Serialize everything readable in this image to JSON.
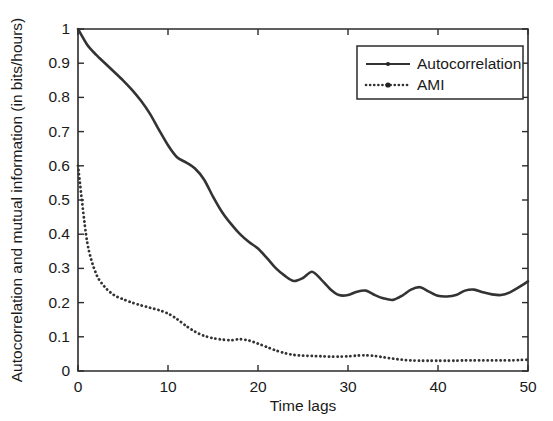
{
  "chart_data": {
    "type": "line",
    "title": "",
    "xlabel": "Time lags",
    "ylabel": "Autocorrelation and mutual information (in bits/hours)",
    "xlim": [
      0,
      50
    ],
    "ylim": [
      0,
      1
    ],
    "xticks": [
      "0",
      "10",
      "20",
      "30",
      "40",
      "50"
    ],
    "xtick_values": [
      0,
      10,
      20,
      30,
      40,
      50
    ],
    "yticks": [
      "0",
      "0.1",
      "0.2",
      "0.3",
      "0.4",
      "0.5",
      "0.6",
      "0.7",
      "0.8",
      "0.9",
      "1"
    ],
    "ytick_values": [
      0,
      0.1,
      0.2,
      0.3,
      0.4,
      0.5,
      0.6,
      0.7,
      0.8,
      0.9,
      1
    ],
    "grid": false,
    "legend_position": "upper right",
    "x": [
      0,
      1,
      2,
      3,
      4,
      5,
      6,
      7,
      8,
      9,
      10,
      11,
      12,
      13,
      14,
      15,
      16,
      17,
      18,
      19,
      20,
      21,
      22,
      23,
      24,
      25,
      26,
      27,
      28,
      29,
      30,
      31,
      32,
      33,
      34,
      35,
      36,
      37,
      38,
      39,
      40,
      41,
      42,
      43,
      44,
      45,
      46,
      47,
      48,
      49,
      50
    ],
    "series": [
      {
        "name": "Autocorrelation",
        "style": "solid",
        "marker": "dot",
        "values": [
          1.0,
          0.955,
          0.925,
          0.9,
          0.875,
          0.85,
          0.822,
          0.79,
          0.752,
          0.705,
          0.66,
          0.625,
          0.61,
          0.592,
          0.56,
          0.51,
          0.465,
          0.43,
          0.4,
          0.377,
          0.358,
          0.33,
          0.3,
          0.278,
          0.263,
          0.272,
          0.29,
          0.268,
          0.24,
          0.222,
          0.222,
          0.232,
          0.235,
          0.222,
          0.212,
          0.208,
          0.22,
          0.238,
          0.245,
          0.232,
          0.22,
          0.218,
          0.222,
          0.235,
          0.238,
          0.23,
          0.224,
          0.222,
          0.23,
          0.245,
          0.262
        ]
      },
      {
        "name": "AMI",
        "style": "dotted",
        "marker": "dot",
        "values": [
          0.6,
          0.38,
          0.285,
          0.245,
          0.222,
          0.21,
          0.2,
          0.192,
          0.185,
          0.178,
          0.168,
          0.152,
          0.132,
          0.115,
          0.103,
          0.096,
          0.092,
          0.09,
          0.093,
          0.089,
          0.08,
          0.07,
          0.06,
          0.052,
          0.047,
          0.045,
          0.044,
          0.043,
          0.042,
          0.042,
          0.043,
          0.045,
          0.046,
          0.044,
          0.04,
          0.036,
          0.033,
          0.031,
          0.03,
          0.03,
          0.03,
          0.03,
          0.03,
          0.031,
          0.031,
          0.031,
          0.031,
          0.031,
          0.031,
          0.032,
          0.033
        ]
      }
    ]
  },
  "legend": {
    "entries": [
      {
        "label": "Autocorrelation",
        "style": "solid"
      },
      {
        "label": "AMI",
        "style": "dotted"
      }
    ]
  },
  "colors": {
    "line": "#333333",
    "axis": "#2b2b2b",
    "background": "#ffffff",
    "text": "#1a1a1a"
  }
}
